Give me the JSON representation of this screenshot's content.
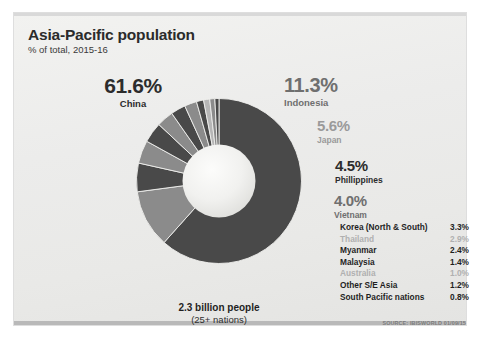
{
  "header": {
    "title": "Asia-Pacific population",
    "subtitle": "% of total, 2015-16"
  },
  "callouts": [
    {
      "pct": "61.6%",
      "name": "China"
    },
    {
      "pct": "11.3%",
      "name": "Indonesia"
    },
    {
      "pct": "5.6%",
      "name": "Japan"
    },
    {
      "pct": "4.5%",
      "name": "Phillippines"
    },
    {
      "pct": "4.0%",
      "name": "Vietnam"
    }
  ],
  "legend": [
    {
      "label": "Korea (North & South)",
      "value": "3.3%"
    },
    {
      "label": "Thailand",
      "value": "2.9%"
    },
    {
      "label": "Myanmar",
      "value": "2.4%"
    },
    {
      "label": "Malaysia",
      "value": "1.4%"
    },
    {
      "label": "Australia",
      "value": "1.0%"
    },
    {
      "label": "Other S/E Asia",
      "value": "1.2%"
    },
    {
      "label": "South Pacific nations",
      "value": "0.8%"
    }
  ],
  "caption": {
    "total": "2.3 billion people",
    "nations": "(25+ nations)"
  },
  "source": "SOURCE: IBISWORLD 01/09/15",
  "colors": {
    "slice_dark": "#494949",
    "slice_mid": "#8b8b8b",
    "slice_light": "#b6b6b6",
    "card_bg": "#eeeeec",
    "text_dark": "#2c2c2c",
    "text_mid": "#6f6f6f",
    "text_faint": "#b0b0b0"
  },
  "chart_data": {
    "type": "pie",
    "title": "Asia-Pacific population",
    "subtitle": "% of total, 2015-16",
    "unit": "% of total",
    "total_label": "2.3 billion people",
    "donut": true,
    "start_angle_deg": 0,
    "direction": "clockwise",
    "categories": [
      "China",
      "Indonesia",
      "Japan",
      "Phillippines",
      "Vietnam",
      "Korea (North & South)",
      "Thailand",
      "Myanmar",
      "Malaysia",
      "Other S/E Asia",
      "Australia",
      "South Pacific nations"
    ],
    "values": [
      61.6,
      11.3,
      5.6,
      4.5,
      4.0,
      3.3,
      2.9,
      2.4,
      1.4,
      1.2,
      1.0,
      0.8
    ],
    "slice_colors": [
      "#494949",
      "#8b8b8b",
      "#494949",
      "#8b8b8b",
      "#494949",
      "#8b8b8b",
      "#494949",
      "#8b8b8b",
      "#494949",
      "#b6b6b6",
      "#8b8b8b",
      "#494949"
    ],
    "legend_position": "right",
    "grid": false,
    "source": "SOURCE: IBISWORLD 01/09/15"
  }
}
